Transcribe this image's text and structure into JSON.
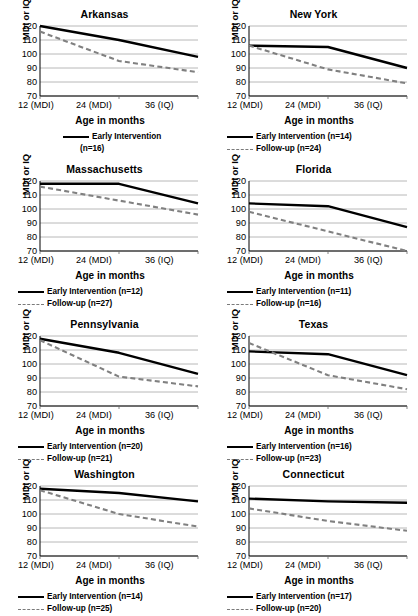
{
  "figure": {
    "ylabel": "MDI or IQ",
    "xlabel": "Age in months",
    "xticks": [
      "12 (MDI)",
      "24 (MDI)",
      "36 (IQ)"
    ],
    "yticks": [
      "70",
      "80",
      "90",
      "100",
      "110",
      "120"
    ],
    "series_names": {
      "early": "Early Intervention",
      "followup": "Follow-up"
    },
    "colors": {
      "early": "#000000",
      "followup": "#808080",
      "grid": "#a6a6a6",
      "axis": "#000000"
    }
  },
  "chart_data": [
    {
      "type": "line",
      "title": "Arkansas",
      "xlabel": "Age in months",
      "ylabel": "MDI or IQ",
      "categories": [
        "12 (MDI)",
        "24 (MDI)",
        "36 (IQ)"
      ],
      "ylim": [
        70,
        120
      ],
      "grid": true,
      "legend_position": "below",
      "series": [
        {
          "name": "Early Intervention",
          "n": 16,
          "legend": "Early Intervention",
          "legend2": "(n=16)",
          "values": [
            120,
            110,
            98
          ],
          "style": "solid"
        },
        {
          "name": "Follow-up",
          "n": null,
          "legend": "",
          "values": [
            116,
            95,
            87
          ],
          "style": "dashed"
        }
      ]
    },
    {
      "type": "line",
      "title": "New York",
      "xlabel": "Age in months",
      "ylabel": "MDI or IQ",
      "categories": [
        "12 (MDI)",
        "24 (MDI)",
        "36 (IQ)"
      ],
      "ylim": [
        70,
        120
      ],
      "grid": true,
      "legend_position": "below",
      "series": [
        {
          "name": "Early Intervention",
          "n": 14,
          "legend": "Early Intervention (n=14)",
          "values": [
            106,
            105,
            90
          ],
          "style": "solid"
        },
        {
          "name": "Follow-up",
          "n": 24,
          "legend": "Follow-up (n=24)",
          "values": [
            106,
            89,
            79
          ],
          "style": "dashed"
        }
      ]
    },
    {
      "type": "line",
      "title": "Massachusetts",
      "xlabel": "Age in months",
      "ylabel": "MDI or IQ",
      "categories": [
        "12 (MDI)",
        "24 (MDI)",
        "36 (IQ)"
      ],
      "ylim": [
        70,
        120
      ],
      "grid": true,
      "legend_position": "below",
      "series": [
        {
          "name": "Early Intervention",
          "n": 12,
          "legend": "Early Intervention (n=12)",
          "values": [
            118,
            118,
            104
          ],
          "style": "solid"
        },
        {
          "name": "Follow-up",
          "n": 27,
          "legend": "Follow-up (n=27)",
          "values": [
            116,
            106,
            96
          ],
          "style": "dashed"
        }
      ]
    },
    {
      "type": "line",
      "title": "Florida",
      "xlabel": "Age in months",
      "ylabel": "MDI or IQ",
      "categories": [
        "12 (MDI)",
        "24 (MDI)",
        "36 (IQ)"
      ],
      "ylim": [
        70,
        120
      ],
      "grid": true,
      "legend_position": "below",
      "series": [
        {
          "name": "Early Intervention",
          "n": 11,
          "legend": "Early Intervention (n=11)",
          "values": [
            104,
            102,
            87
          ],
          "style": "solid"
        },
        {
          "name": "Follow-up",
          "n": 16,
          "legend": "Follow-up (n=16)",
          "values": [
            98,
            84,
            70
          ],
          "style": "dashed"
        }
      ]
    },
    {
      "type": "line",
      "title": "Pennsylvania",
      "xlabel": "Age in months",
      "ylabel": "MDI or IQ",
      "categories": [
        "12 (MDI)",
        "24 (MDI)",
        "36 (IQ)"
      ],
      "ylim": [
        70,
        120
      ],
      "grid": true,
      "legend_position": "below",
      "series": [
        {
          "name": "Early Intervention",
          "n": 20,
          "legend": "Early Intervention (n=20)",
          "values": [
            118,
            108,
            93
          ],
          "style": "solid"
        },
        {
          "name": "Follow-up",
          "n": 21,
          "legend": "Follow-up (n=21)",
          "values": [
            117,
            91,
            84
          ],
          "style": "dashed"
        }
      ]
    },
    {
      "type": "line",
      "title": "Texas",
      "xlabel": "Age in months",
      "ylabel": "MDI or IQ",
      "categories": [
        "12 (MDI)",
        "24 (MDI)",
        "36 (IQ)"
      ],
      "ylim": [
        70,
        120
      ],
      "grid": true,
      "legend_position": "below",
      "series": [
        {
          "name": "Early Intervention",
          "n": 16,
          "legend": "Early Intervention (n=16)",
          "values": [
            109,
            107,
            92
          ],
          "style": "solid"
        },
        {
          "name": "Follow-up",
          "n": 23,
          "legend": "Follow-up (n=23)",
          "values": [
            115,
            92,
            82
          ],
          "style": "dashed"
        }
      ]
    },
    {
      "type": "line",
      "title": "Washington",
      "xlabel": "Age in months",
      "ylabel": "MDI or IQ",
      "categories": [
        "12 (MDI)",
        "24 (MDI)",
        "36 (IQ)"
      ],
      "ylim": [
        70,
        120
      ],
      "grid": true,
      "legend_position": "below",
      "series": [
        {
          "name": "Early Intervention",
          "n": 14,
          "legend": "Early Intervention (n=14)",
          "values": [
            118,
            115,
            109
          ],
          "style": "solid"
        },
        {
          "name": "Follow-up",
          "n": 25,
          "legend": "Follow-up (n=25)",
          "values": [
            117,
            100,
            91
          ],
          "style": "dashed"
        }
      ]
    },
    {
      "type": "line",
      "title": "Connecticut",
      "xlabel": "Age in months",
      "ylabel": "MDI or IQ",
      "categories": [
        "12 (MDI)",
        "24 (MDI)",
        "36 (IQ)"
      ],
      "ylim": [
        70,
        120
      ],
      "grid": true,
      "legend_position": "below",
      "series": [
        {
          "name": "Early Intervention",
          "n": 17,
          "legend": "Early Intervention (n=17)",
          "values": [
            111,
            109,
            108
          ],
          "style": "solid"
        },
        {
          "name": "Follow-up",
          "n": 20,
          "legend": "Follow-up (n=20)",
          "values": [
            104,
            95,
            88
          ],
          "style": "dashed"
        }
      ]
    }
  ]
}
